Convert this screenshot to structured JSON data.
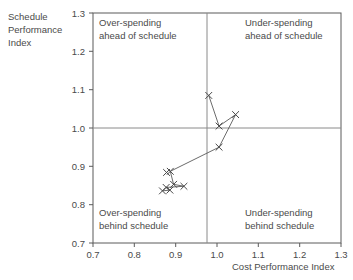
{
  "chart_data": {
    "type": "scatter",
    "title": "",
    "xlabel": "Cost Performance Index",
    "ylabel": "Schedule Performance Index",
    "xlim": [
      0.7,
      1.3
    ],
    "ylim": [
      0.7,
      1.3
    ],
    "xticks": [
      "0.7",
      "0.8",
      "0.9",
      "1.0",
      "1.1",
      "1.2",
      "1.3"
    ],
    "yticks": [
      "0.7",
      "0.8",
      "0.9",
      "1.0",
      "1.1",
      "1.2",
      "1.3"
    ],
    "grid": false,
    "legend": "none",
    "marker": "x",
    "connected": true,
    "reference_lines": {
      "x": 1.0,
      "y": 1.0
    },
    "annotations": [
      {
        "id": "top-left",
        "line1": "Over-spending",
        "line2": "ahead of schedule"
      },
      {
        "id": "top-right",
        "line1": "Under-spending",
        "line2": "ahead of schedule"
      },
      {
        "id": "bottom-left",
        "line1": "Over-spending",
        "line2": "behind schedule"
      },
      {
        "id": "bottom-right",
        "line1": "Under-spending",
        "line2": "behind schedule"
      }
    ],
    "points": [
      {
        "x": 0.98,
        "y": 1.085
      },
      {
        "x": 1.045,
        "y": 1.035
      },
      {
        "x": 1.005,
        "y": 1.005
      },
      {
        "x": 1.005,
        "y": 0.95
      },
      {
        "x": 0.887,
        "y": 0.887
      },
      {
        "x": 0.878,
        "y": 0.884
      },
      {
        "x": 0.895,
        "y": 0.853
      },
      {
        "x": 0.92,
        "y": 0.848
      },
      {
        "x": 0.877,
        "y": 0.845
      },
      {
        "x": 0.886,
        "y": 0.838
      },
      {
        "x": 0.868,
        "y": 0.836
      }
    ],
    "path_order": [
      0,
      2,
      1,
      3,
      4,
      6,
      7,
      8,
      9,
      10
    ]
  },
  "axis_titles": {
    "y_line1": "Schedule",
    "y_line2": "Performance",
    "y_line3": "Index",
    "x": "Cost Performance Index"
  }
}
